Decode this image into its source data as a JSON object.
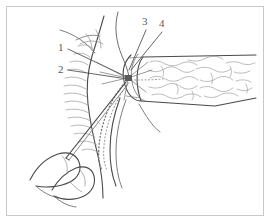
{
  "figure": {
    "domain": "medical-anatomical-line-drawing",
    "background_color": "#ffffff",
    "frame": {
      "border_color": "#c8c8c8",
      "inset_px": 6,
      "width_px": 258,
      "height_px": 210
    },
    "ink": {
      "outline_color": "#4a4a4a",
      "light_color": "#8c8c8c",
      "texture_color": "#9a9a9a",
      "dotted_color": "#7a7a7a",
      "label_color": "#5a5a5a"
    },
    "labels": [
      {
        "text": "1",
        "x": 58,
        "y": 42
      },
      {
        "text": "2",
        "x": 58,
        "y": 64
      },
      {
        "text": "3",
        "x": 142,
        "y": 16
      },
      {
        "text": "4",
        "x": 159,
        "y": 18
      }
    ],
    "convergence_point": {
      "x": 128,
      "y": 78
    },
    "leader_lines": [
      {
        "label": "1",
        "from": [
          68,
          49
        ],
        "to": [
          127,
          77
        ]
      },
      {
        "label": "2",
        "from": [
          68,
          70
        ],
        "to": [
          127,
          79
        ]
      },
      {
        "label": "3",
        "from": [
          146,
          30
        ],
        "to": [
          129,
          70
        ]
      },
      {
        "label": "4",
        "from": [
          162,
          32
        ],
        "to": [
          131,
          70
        ]
      }
    ],
    "annotations": {
      "tissue_texture": "squiggly striation lines",
      "catheter_path": "dotted curved line",
      "instrument": "needle shaft held between two fingers"
    }
  }
}
